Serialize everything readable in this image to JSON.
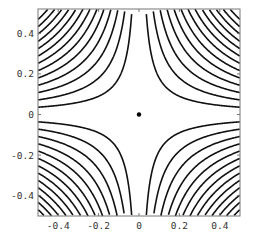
{
  "chart_data": {
    "type": "contour",
    "title": "",
    "xlabel": "",
    "ylabel": "",
    "xlim": [
      -0.5,
      0.5
    ],
    "ylim": [
      -0.5,
      0.52
    ],
    "function": "x*y",
    "contour_levels": [
      -0.234,
      -0.216,
      -0.198,
      -0.18,
      -0.162,
      -0.144,
      -0.126,
      -0.108,
      -0.09,
      -0.072,
      -0.054,
      -0.036,
      -0.018,
      0.018,
      0.036,
      0.054,
      0.072,
      0.09,
      0.108,
      0.126,
      0.144,
      0.162,
      0.18,
      0.198,
      0.216,
      0.234
    ],
    "x_ticks": [
      -0.4,
      -0.2,
      0,
      0.2,
      0.4
    ],
    "x_tick_labels": [
      "-0.4",
      "-0.2",
      "0",
      "0.2",
      "0.4"
    ],
    "y_ticks": [
      -0.4,
      -0.2,
      0,
      0.2,
      0.4
    ],
    "y_tick_labels": [
      "-0.4",
      "-0.2",
      "0",
      "0.2",
      "0.4"
    ],
    "point": {
      "x": 0,
      "y": 0,
      "label": ""
    },
    "grid": false,
    "legend": null,
    "line_color": "#111111"
  }
}
